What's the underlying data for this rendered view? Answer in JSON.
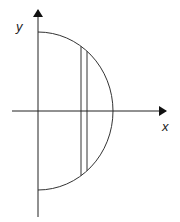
{
  "diagram": {
    "type": "semicircle-region-with-vertical-strip",
    "colors": {
      "stroke": "#333333",
      "axis": "#222222",
      "background": "#ffffff"
    },
    "axes": {
      "x_label": "x",
      "y_label": "y",
      "origin": [
        38,
        111
      ],
      "x_axis": {
        "from": 12,
        "to": 166
      },
      "y_axis": {
        "from": 217,
        "to": 10
      }
    },
    "semicircle": {
      "center": [
        38,
        111
      ],
      "radius_x": 75,
      "radius_y": 79,
      "side": "right"
    },
    "strip": {
      "x_left": 81,
      "x_right": 87
    }
  }
}
